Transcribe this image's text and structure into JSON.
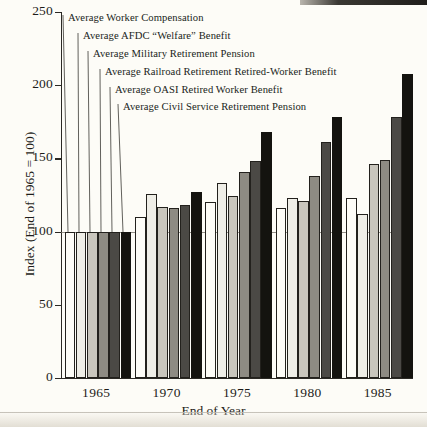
{
  "chart_data": {
    "type": "bar",
    "title": "",
    "xlabel": "End of Year",
    "ylabel": "Index (End of 1965 = 100)",
    "categories": [
      "1965",
      "1970",
      "1975",
      "1980",
      "1985"
    ],
    "ylim": [
      0,
      250
    ],
    "yticks": [
      0,
      50,
      100,
      150,
      200,
      250
    ],
    "grid": false,
    "reference_line": 100,
    "legend_position": "top-left",
    "series": [
      {
        "name": "Average Worker Compensation",
        "shade": "white",
        "color": "#fdfcf7",
        "values": [
          100,
          110,
          120,
          116,
          123
        ]
      },
      {
        "name": "Average AFDC “Welfare” Benefit",
        "shade": "very-light",
        "color": "#efeee7",
        "values": [
          100,
          126,
          133,
          123,
          112
        ]
      },
      {
        "name": "Average Military Retirement Pension",
        "shade": "light-gray",
        "color": "#c9c6bd",
        "values": [
          100,
          117,
          124,
          121,
          146
        ]
      },
      {
        "name": "Average Railroad Retirement Retired-Worker Benefit",
        "shade": "medium-gray",
        "color": "#8e8b83",
        "values": [
          100,
          116,
          141,
          138,
          149
        ]
      },
      {
        "name": "Average OASI Retired Worker Benefit",
        "shade": "dark-gray",
        "color": "#4b4945",
        "values": [
          100,
          118,
          148,
          161,
          178
        ]
      },
      {
        "name": "Average Civil Service Retirement Pension",
        "shade": "black",
        "color": "#14130f",
        "values": [
          100,
          127,
          168,
          178,
          208
        ]
      }
    ]
  }
}
